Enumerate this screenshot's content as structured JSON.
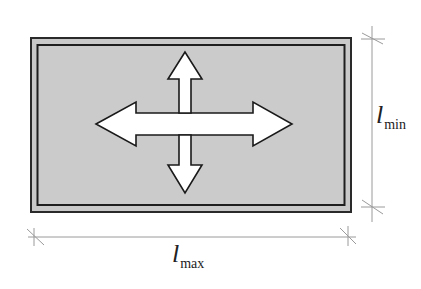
{
  "diagram": {
    "panel": {
      "fill": "#c9c9c9",
      "stroke": "#2a2a2a"
    },
    "arrows": {
      "fill": "#ffffff",
      "stroke": "#1a1a1a",
      "directions": [
        "left",
        "right",
        "up",
        "down"
      ]
    },
    "dimensions": {
      "short_side": {
        "symbol": "l",
        "subscript": "min"
      },
      "long_side": {
        "symbol": "l",
        "subscript": "max"
      }
    },
    "dimension_line_color": "#9a9a9a"
  }
}
